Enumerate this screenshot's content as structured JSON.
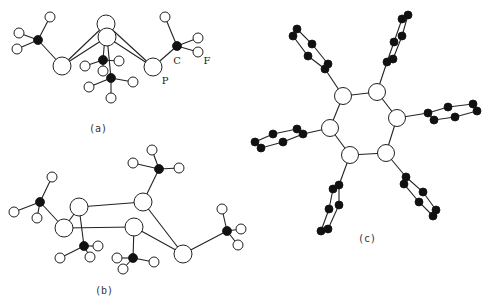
{
  "figure": {
    "panels": [
      {
        "id": "a",
        "caption": "(a)",
        "atom_labels": {
          "P": "P",
          "C": "C",
          "F": "F"
        }
      },
      {
        "id": "b",
        "caption": "(b)"
      },
      {
        "id": "c",
        "caption": "(c)"
      }
    ],
    "colors": {
      "carbon": "#111111",
      "outline": "#222222",
      "background": "#ffffff"
    }
  },
  "legend_text": {
    "a": "(a)",
    "b": "(b)",
    "c": "(c)",
    "P": "P",
    "C": "C",
    "F": "F"
  }
}
